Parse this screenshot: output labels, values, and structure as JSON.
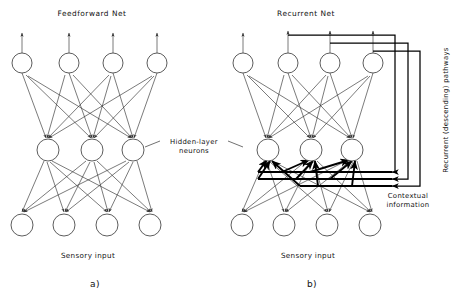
{
  "figure": {
    "caption_a": "a)",
    "caption_b": "b)",
    "panel_a": {
      "title": "Feedforward Net",
      "input_label": "Sensory input",
      "layers": {
        "output_count": 4,
        "hidden_count": 3,
        "input_count": 4
      }
    },
    "panel_b": {
      "title": "Recurrent Net",
      "input_label": "Sensory input",
      "layers": {
        "output_count": 4,
        "hidden_count": 3,
        "input_count": 4
      },
      "recurrent_label": "Recurrent (descending) pathways",
      "contextual_label_line1": "Contextual",
      "contextual_label_line2": "information",
      "recurrent_pathway_count": 3
    },
    "annotations": {
      "hidden_layer_line1": "Hidden-layer",
      "hidden_layer_line2": "neurons"
    },
    "colors": {
      "ink": "#111111",
      "stroke": "#333333",
      "bold_stroke": "#000000",
      "background": "#ffffff"
    }
  }
}
